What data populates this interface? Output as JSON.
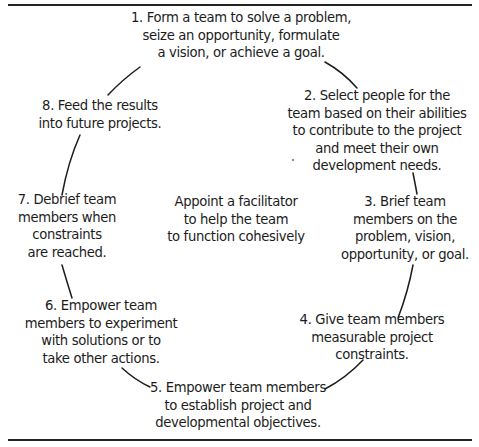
{
  "diagram": {
    "type": "cycle",
    "center": {
      "lines": [
        "Appoint a facilitator",
        "to help the team",
        "to function cohesively"
      ]
    },
    "steps": [
      {
        "id": 1,
        "lines": [
          "1. Form a team to solve a problem,",
          "seize an opportunity, formulate",
          "a vision, or achieve a goal."
        ]
      },
      {
        "id": 2,
        "lines": [
          "2. Select people for the",
          "team based on their abilities",
          "to contribute to the project",
          "and meet their own",
          "development needs."
        ]
      },
      {
        "id": 3,
        "lines": [
          "3. Brief team",
          "members on the",
          "problem, vision,",
          "opportunity, or goal."
        ]
      },
      {
        "id": 4,
        "lines": [
          "4. Give team members",
          "measurable project",
          "constraints."
        ]
      },
      {
        "id": 5,
        "lines": [
          "5. Empower team members",
          "to establish project and",
          "developmental objectives."
        ]
      },
      {
        "id": 6,
        "lines": [
          "6. Empower team",
          "members to experiment",
          "with solutions or to",
          "take other actions."
        ]
      },
      {
        "id": 7,
        "lines": [
          "7. Debrief team",
          "members when",
          "constraints",
          "are reached."
        ]
      },
      {
        "id": 8,
        "lines": [
          "8. Feed the results",
          "into future projects."
        ]
      }
    ],
    "connections": [
      {
        "from": 1,
        "to": 2
      },
      {
        "from": 2,
        "to": 3
      },
      {
        "from": 3,
        "to": 4
      },
      {
        "from": 4,
        "to": 5
      },
      {
        "from": 5,
        "to": 6
      },
      {
        "from": 6,
        "to": 7
      },
      {
        "from": 7,
        "to": 8
      },
      {
        "from": 8,
        "to": 1
      }
    ],
    "colors": {
      "text": "#1c1c1c",
      "rule": "#222222",
      "background": "#ffffff"
    }
  }
}
